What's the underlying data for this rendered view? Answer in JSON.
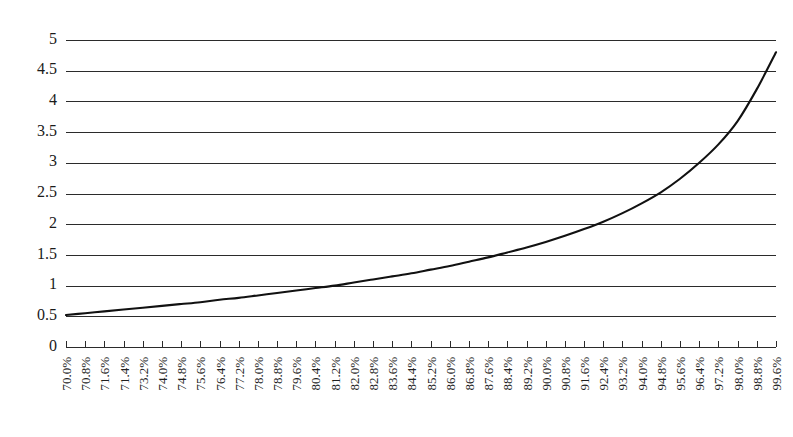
{
  "chart_data": {
    "type": "line",
    "title": "",
    "subtitle": "",
    "xlabel": "",
    "ylabel": "",
    "grid": true,
    "grid_axis": "y",
    "legend": false,
    "legend_position": "none",
    "xlim": [
      0,
      37
    ],
    "ylim": [
      0,
      5
    ],
    "ytick_values": [
      0,
      0.5,
      1,
      1.5,
      2,
      2.5,
      3,
      3.5,
      4,
      4.5,
      5
    ],
    "ytick_labels": [
      "0",
      "0.5",
      "1",
      "1.5",
      "2",
      "2.5",
      "3",
      "3.5",
      "4",
      "4.5",
      "5"
    ],
    "categories": [
      "70.0%",
      "70.8%",
      "71.6%",
      "71.4%",
      "73.2%",
      "74.0%",
      "74.8%",
      "75.6%",
      "76.4%",
      "77.2%",
      "78.0%",
      "78.8%",
      "79.6%",
      "80.4%",
      "81.2%",
      "82.0%",
      "82.8%",
      "83.6%",
      "84.4%",
      "85.2%",
      "86.0%",
      "86.8%",
      "87.6%",
      "88.4%",
      "89.2%",
      "90.0%",
      "90.8%",
      "91.6%",
      "92.4%",
      "93.2%",
      "94.0%",
      "94.8%",
      "95.6%",
      "96.4%",
      "97.2%",
      "98.0%",
      "98.8%",
      "99.6%"
    ],
    "xtick_rotation": -90,
    "series": [
      {
        "name": "",
        "color": "#111111",
        "values": [
          0.52,
          0.55,
          0.58,
          0.61,
          0.64,
          0.67,
          0.7,
          0.73,
          0.77,
          0.8,
          0.84,
          0.88,
          0.92,
          0.96,
          1.0,
          1.05,
          1.1,
          1.15,
          1.2,
          1.26,
          1.32,
          1.39,
          1.46,
          1.54,
          1.62,
          1.71,
          1.81,
          1.92,
          2.04,
          2.18,
          2.34,
          2.52,
          2.74,
          3.0,
          3.3,
          3.68,
          4.2,
          4.8
        ]
      }
    ],
    "annotations": []
  }
}
